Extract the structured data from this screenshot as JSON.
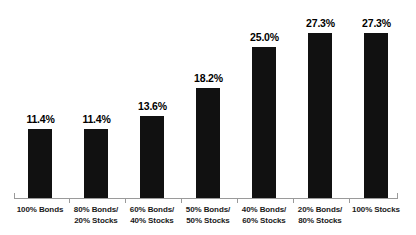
{
  "chart_data": {
    "type": "bar",
    "title": "",
    "subtitle": "",
    "xlabel": "",
    "ylabel": "",
    "ylim": [
      0,
      30
    ],
    "grid": false,
    "legend": "none",
    "bar_color": "#111111",
    "axis_color": "#9a9a9a",
    "background": "#ffffff",
    "categories": [
      "100% Bonds",
      "80% Bonds/ 20% Stocks",
      "60% Bonds/ 40% Stocks",
      "50% Bonds/ 50% Stocks",
      "40% Bonds/ 60% Stocks",
      "20% Bonds/ 80% Stocks",
      "100% Stocks"
    ],
    "category_lines": [
      [
        "100% Bonds",
        ""
      ],
      [
        "80% Bonds/",
        "20% Stocks"
      ],
      [
        "60% Bonds/",
        "40% Stocks"
      ],
      [
        "50% Bonds/",
        "50% Stocks"
      ],
      [
        "40% Bonds/",
        "60% Stocks"
      ],
      [
        "20% Bonds/",
        "80% Stocks"
      ],
      [
        "100% Stocks",
        ""
      ]
    ],
    "values": [
      11.4,
      11.4,
      13.6,
      18.2,
      25.0,
      27.3,
      27.3
    ],
    "data_labels": [
      "11.4%",
      "11.4%",
      "13.6%",
      "18.2%",
      "25.0%",
      "27.3%",
      "27.3%"
    ]
  }
}
